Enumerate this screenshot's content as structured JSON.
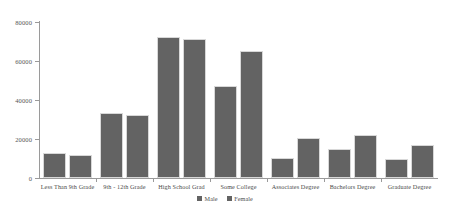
{
  "chart_data": {
    "type": "bar",
    "title": "",
    "subtitle": "",
    "xlabel": "",
    "ylabel": "",
    "grid": false,
    "legend_position": "bottom-center",
    "ylim": [
      0,
      80000
    ],
    "yticks": [
      0,
      20000,
      40000,
      60000,
      80000
    ],
    "ytick_labels": [
      "0",
      "20000",
      "40000",
      "60000",
      "80000"
    ],
    "categories": [
      "Less Than 9th Grade",
      "9th - 12th Grade",
      "High School Grad",
      "Some College",
      "Associates Degree",
      "Bachelors Degree",
      "Graduate Degree"
    ],
    "series": [
      {
        "name": "Male",
        "color": "#636363",
        "values": [
          13000,
          33000,
          72000,
          47000,
          10000,
          15000,
          9500
        ]
      },
      {
        "name": "Female",
        "color": "#636363",
        "values": [
          12000,
          32000,
          71000,
          65000,
          20500,
          22000,
          17000
        ]
      }
    ]
  },
  "legend": {
    "items": [
      {
        "label": "Male",
        "color": "#636363"
      },
      {
        "label": "Female",
        "color": "#636363"
      }
    ]
  }
}
